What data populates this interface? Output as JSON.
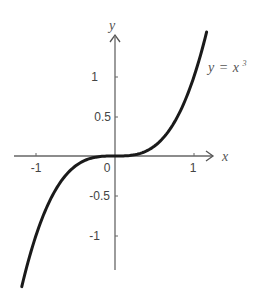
{
  "chart_data": {
    "type": "line",
    "title": "",
    "function": "y = x^3",
    "xlabel": "x",
    "ylabel": "y",
    "xlim": [
      -1.25,
      1.3
    ],
    "ylim": [
      -1.45,
      1.55
    ],
    "grid": false,
    "legend": null,
    "x_ticks": [
      -1,
      0,
      1
    ],
    "x_tick_labels": [
      "-1",
      "0",
      "1"
    ],
    "y_ticks": [
      -1,
      -0.5,
      0.5,
      1
    ],
    "y_tick_labels": [
      "-1",
      "-0.5",
      "0.5",
      "1"
    ],
    "annotations": [
      {
        "text": "y = x³",
        "x": 1.15,
        "y": 1.1
      }
    ],
    "series": [
      {
        "name": "y = x^3",
        "x": [
          -1.18,
          -1.1,
          -1.0,
          -0.9,
          -0.8,
          -0.7,
          -0.6,
          -0.5,
          -0.4,
          -0.3,
          -0.2,
          -0.1,
          0,
          0.1,
          0.2,
          0.3,
          0.4,
          0.5,
          0.6,
          0.7,
          0.8,
          0.9,
          1.0,
          1.1,
          1.16
        ],
        "y": [
          -1.643,
          -1.331,
          -1.0,
          -0.729,
          -0.512,
          -0.343,
          -0.216,
          -0.125,
          -0.064,
          -0.027,
          -0.008,
          -0.001,
          0,
          0.001,
          0.008,
          0.027,
          0.064,
          0.125,
          0.216,
          0.343,
          0.512,
          0.729,
          1.0,
          1.331,
          1.561
        ]
      }
    ]
  },
  "labels": {
    "x_axis": "x",
    "y_axis": "y",
    "curve_y": "y",
    "curve_eq": "=",
    "curve_x": "x",
    "curve_exp": "3",
    "tick_x_neg1": "-1",
    "tick_x_0": "0",
    "tick_x_1": "1",
    "tick_y_1": "1",
    "tick_y_05": "0.5",
    "tick_y_neg05": "-0.5",
    "tick_y_neg1": "-1"
  },
  "colors": {
    "axis": "#666666",
    "curve": "#1a1a1a",
    "text": "#444444"
  }
}
